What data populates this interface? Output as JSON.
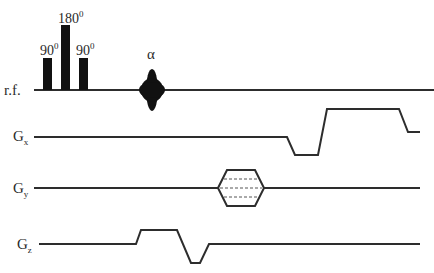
{
  "diagram": {
    "type": "pulse-sequence",
    "channels": [
      {
        "id": "rf",
        "label": "r.f."
      },
      {
        "id": "gx",
        "label": "G",
        "subscript": "x"
      },
      {
        "id": "gy",
        "label": "G",
        "subscript": "y"
      },
      {
        "id": "gz",
        "label": "G",
        "subscript": "z"
      }
    ],
    "rf_pulses": [
      {
        "label": "90",
        "superscript": "0"
      },
      {
        "label": "180",
        "superscript": "0"
      },
      {
        "label": "90",
        "superscript": "0"
      },
      {
        "label": "α"
      }
    ],
    "colors": {
      "trace": "#2d2d2d",
      "pulse": "#111111",
      "background": "#ffffff"
    }
  }
}
